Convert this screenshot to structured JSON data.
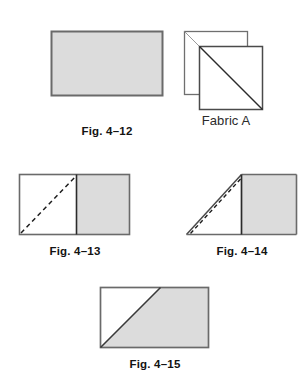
{
  "page": {
    "background_color": "#ffffff"
  },
  "style": {
    "fill_gray": "#dcdcdc",
    "stroke_dark": "#4a4a4a",
    "stroke_black": "#2b2b2b",
    "stroke_light": "#8c8c8c",
    "text_color": "#131313"
  },
  "figures": [
    {
      "id": "fig-4-12",
      "caption": "Fig. 4–12",
      "shape": "filled-rectangle",
      "description": "Solid gray rectangle of fabric",
      "x": 51,
      "y": 31,
      "width": 111,
      "height": 64
    },
    {
      "id": "fabric-a",
      "caption": "Fabric A",
      "shape": "two-stacked-squares-with-diagonals",
      "description": "Two white squares offset and stacked, each with a diagonal line from top-left to bottom-right",
      "back_square": {
        "x": 184,
        "y": 31,
        "size": 63
      },
      "front_square": {
        "x": 199,
        "y": 46,
        "size": 63
      }
    },
    {
      "id": "fig-4-13",
      "caption": "Fig. 4–13",
      "shape": "rectangle-half-filled-with-dashed-diagonal",
      "description": "Rectangle split vertically; right half gray, left half white with a dashed diagonal from bottom-left to top of divider",
      "x": 19,
      "y": 174,
      "width": 110,
      "height": 60,
      "divider_x": 76
    },
    {
      "id": "fig-4-14",
      "caption": "Fig. 4–14",
      "shape": "folded-triangle-with-filled-rectangle",
      "description": "Right portion gray rectangle; left portion folded into a triangle with a dashed fold line parallel to the solid edge",
      "x": 186,
      "y": 174,
      "width": 110,
      "height": 60,
      "divider_x": 241
    },
    {
      "id": "fig-4-15",
      "caption": "Fig. 4–15",
      "shape": "rectangle-with-diagonal-fill",
      "description": "Rectangle with diagonal from bottom-left to a point on the top edge; area to the right of the diagonal is gray",
      "x": 100,
      "y": 287,
      "width": 108,
      "height": 60,
      "diagonal_top_x": 160
    }
  ],
  "captions": {
    "fig_4_12": "Fig. 4–12",
    "fabric_a": "Fabric A",
    "fig_4_13": "Fig. 4–13",
    "fig_4_14": "Fig. 4–14",
    "fig_4_15": "Fig. 4–15"
  }
}
